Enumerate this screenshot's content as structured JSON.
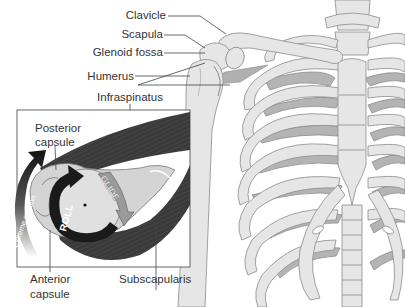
{
  "diagram": {
    "labels": {
      "clavicle": "Clavicle",
      "scapula": "Scapula",
      "glenoid_fossa": "Glenoid fossa",
      "humerus": "Humerus",
      "infraspinatus": "Infraspinatus",
      "posterior_capsule_line1": "Posterior",
      "posterior_capsule_line2": "capsule",
      "anterior_capsule_line1": "Anterior",
      "anterior_capsule_line2": "capsule",
      "subscapularis": "Subscapularis"
    },
    "arrows": {
      "extreme_rotation": "Extreme rotation",
      "roll": "ROLL",
      "glide": "GLIDE"
    },
    "colors": {
      "bone_fill": "#e6e6e6",
      "bone_stroke": "#8c8c8c",
      "rib_shadow": "#b4b4b4",
      "muscle_dark": "#3c3c3c",
      "text": "#333333",
      "leader_line": "#444444",
      "inset_border": "#555555"
    }
  }
}
